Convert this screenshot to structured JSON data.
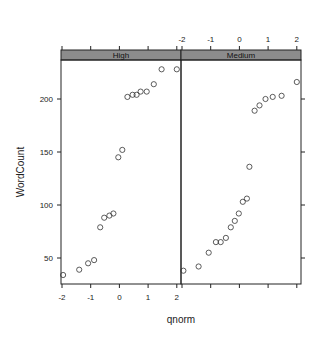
{
  "chart_data": {
    "type": "scatter",
    "subtype": "lattice-qqmath",
    "title": "",
    "xlabel": "qnorm",
    "ylabel": "WordCount",
    "xlim": [
      -2,
      2
    ],
    "ylim": [
      30,
      235
    ],
    "x_ticks": [
      -2,
      -1,
      0,
      1,
      2
    ],
    "y_ticks": [
      50,
      100,
      150,
      200
    ],
    "grid": false,
    "legend": null,
    "strip_color": "#8c8c8c",
    "point_color": "#333333",
    "panels": [
      {
        "name": "High",
        "points": [
          {
            "x": -1.96,
            "y": 34
          },
          {
            "x": -1.4,
            "y": 39
          },
          {
            "x": -1.09,
            "y": 45
          },
          {
            "x": -0.88,
            "y": 48
          },
          {
            "x": -0.67,
            "y": 79
          },
          {
            "x": -0.53,
            "y": 88
          },
          {
            "x": -0.35,
            "y": 90
          },
          {
            "x": -0.21,
            "y": 92
          },
          {
            "x": -0.04,
            "y": 145
          },
          {
            "x": 0.1,
            "y": 152
          },
          {
            "x": 0.28,
            "y": 202
          },
          {
            "x": 0.46,
            "y": 204
          },
          {
            "x": 0.6,
            "y": 204
          },
          {
            "x": 0.74,
            "y": 207
          },
          {
            "x": 0.95,
            "y": 207
          },
          {
            "x": 1.2,
            "y": 214
          },
          {
            "x": 1.47,
            "y": 228
          },
          {
            "x": 2.0,
            "y": 228
          }
        ]
      },
      {
        "name": "Medium",
        "points": [
          {
            "x": -1.95,
            "y": 38
          },
          {
            "x": -1.42,
            "y": 42
          },
          {
            "x": -1.07,
            "y": 55
          },
          {
            "x": -0.82,
            "y": 65
          },
          {
            "x": -0.65,
            "y": 65
          },
          {
            "x": -0.47,
            "y": 69
          },
          {
            "x": -0.3,
            "y": 79
          },
          {
            "x": -0.16,
            "y": 85
          },
          {
            "x": -0.02,
            "y": 92
          },
          {
            "x": 0.12,
            "y": 103
          },
          {
            "x": 0.26,
            "y": 106
          },
          {
            "x": 0.35,
            "y": 136
          },
          {
            "x": 0.53,
            "y": 189
          },
          {
            "x": 0.7,
            "y": 194
          },
          {
            "x": 0.91,
            "y": 200
          },
          {
            "x": 1.16,
            "y": 202
          },
          {
            "x": 1.47,
            "y": 203
          },
          {
            "x": 2.0,
            "y": 216
          }
        ]
      }
    ]
  }
}
